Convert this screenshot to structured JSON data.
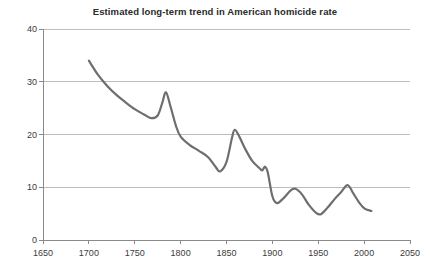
{
  "chart_data": {
    "type": "line",
    "title": "Estimated long-term trend in American homicide rate",
    "xlabel": "",
    "ylabel": "",
    "xlim": [
      1650,
      2050
    ],
    "ylim": [
      0,
      40
    ],
    "grid": "horizontal",
    "legend": "none",
    "xticks": [
      1650,
      1700,
      1750,
      1800,
      1850,
      1900,
      1950,
      2000,
      2050
    ],
    "yticks": [
      0,
      10,
      20,
      30,
      40
    ],
    "xtick_labels": [
      "1650",
      "1700",
      "1750",
      "1800",
      "1850",
      "1900",
      "1950",
      "2000",
      "2050"
    ],
    "ytick_labels": [
      "0",
      "10",
      "20",
      "30",
      "40"
    ],
    "line_color": "#6e6e6e",
    "line_width": 2.2,
    "series": [
      {
        "name": "American homicide rate",
        "x": [
          1700,
          1710,
          1720,
          1730,
          1740,
          1750,
          1760,
          1768,
          1775,
          1780,
          1784,
          1789,
          1795,
          1800,
          1810,
          1820,
          1830,
          1838,
          1843,
          1850,
          1856,
          1859,
          1864,
          1870,
          1878,
          1886,
          1889,
          1892,
          1895,
          1900,
          1905,
          1912,
          1920,
          1925,
          1932,
          1940,
          1948,
          1953,
          1960,
          1968,
          1975,
          1982,
          1988,
          1995,
          2001,
          2008
        ],
        "y": [
          34.0,
          31.3,
          29.2,
          27.5,
          26.1,
          24.8,
          23.8,
          23.1,
          23.6,
          26.0,
          28.0,
          25.3,
          21.6,
          19.6,
          18.0,
          16.9,
          15.7,
          13.9,
          13.0,
          14.8,
          19.4,
          20.9,
          19.6,
          17.4,
          15.0,
          13.6,
          13.2,
          13.9,
          12.8,
          8.3,
          7.0,
          7.9,
          9.4,
          9.7,
          8.7,
          6.6,
          5.1,
          4.9,
          6.1,
          7.8,
          9.1,
          10.4,
          8.9,
          7.0,
          5.9,
          5.5
        ]
      }
    ]
  }
}
